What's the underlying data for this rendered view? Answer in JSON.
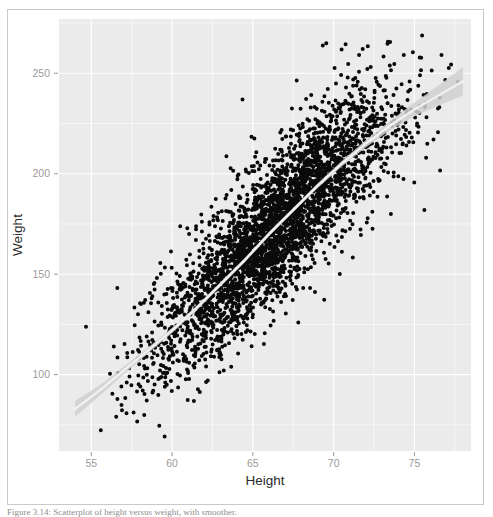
{
  "figure": {
    "caption": "Figure 3.14: Scatterplot of height versus weight, with smoother."
  },
  "chart_data": {
    "type": "scatter",
    "title": "",
    "xlabel": "Height",
    "ylabel": "Weight",
    "xlim": [
      53.0,
      78.5
    ],
    "ylim": [
      62,
      277
    ],
    "xticks": [
      55,
      60,
      65,
      70,
      75
    ],
    "xtick_labels": [
      "55",
      "60",
      "65",
      "70",
      "75"
    ],
    "yticks": [
      100,
      150,
      200,
      250
    ],
    "ytick_labels": [
      "100",
      "150",
      "200",
      "250"
    ],
    "grid": true,
    "legend": "none",
    "n_points": 6000,
    "point_color": "#0a0a0a",
    "point_size": 2.0,
    "panel_background": "#ebebeb",
    "gridline_color": "#ffffff",
    "tick_label_color": "#9a9a9a",
    "axis_title_color": "#2b2b2b",
    "correlation_description": "strong positive",
    "smoother": {
      "type": "loess",
      "line_color": "#f2f2f2",
      "band_color": "#d0d0d0",
      "x": [
        54.0,
        55.5,
        57.0,
        58.5,
        60.0,
        61.5,
        63.0,
        64.5,
        66.0,
        67.5,
        69.0,
        70.5,
        72.0,
        73.5,
        75.0,
        76.5,
        78.0
      ],
      "y": [
        83,
        92,
        102,
        112,
        122,
        133,
        145,
        157,
        170,
        182,
        194,
        205,
        215,
        224,
        232,
        239,
        246
      ],
      "band_halfwidth": [
        4.0,
        2.6,
        1.9,
        1.5,
        1.3,
        1.2,
        1.1,
        1.1,
        1.1,
        1.1,
        1.2,
        1.4,
        1.8,
        2.4,
        3.4,
        5.0,
        7.0
      ]
    },
    "distribution": {
      "x_mean": 66.4,
      "x_sd": 3.6,
      "y_sd_residual": 17.5,
      "description": "Dense elliptical cloud of points trending upward from lower-left to upper-right; sparse outliers below the main band near the lower-left and above the band near the upper-right."
    }
  }
}
